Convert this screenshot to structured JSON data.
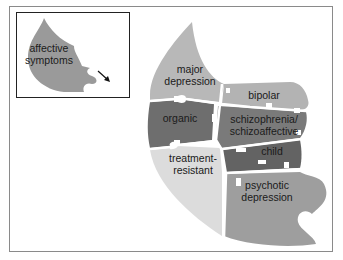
{
  "inset": {
    "piece_label_line1": "affective",
    "piece_label_line2": "symptoms",
    "arrow_icon": "arrow-down-right"
  },
  "puzzle": {
    "pieces": [
      {
        "id": "major-depression",
        "line1": "major",
        "line2": "depression",
        "color": "#b8b8b8"
      },
      {
        "id": "bipolar",
        "line1": "bipolar",
        "line2": "",
        "color": "#b3b3b3"
      },
      {
        "id": "organic",
        "line1": "organic",
        "line2": "",
        "color": "#6e6e6e"
      },
      {
        "id": "schizophrenia",
        "line1": "schizophrenia/",
        "line2": "schizoaffective",
        "color": "#7a7a7a"
      },
      {
        "id": "child",
        "line1": "child",
        "line2": "",
        "color": "#636363"
      },
      {
        "id": "treatment-resistant",
        "line1": "treatment-",
        "line2": "resistant",
        "color": "#dcdcdc"
      },
      {
        "id": "psychotic-depression",
        "line1": "psychotic",
        "line2": "depression",
        "color": "#9e9e9e"
      }
    ]
  },
  "colors": {
    "inset_piece": "#9a9a9a",
    "frame_border": "#8a8a8a",
    "inset_border": "#222222"
  }
}
